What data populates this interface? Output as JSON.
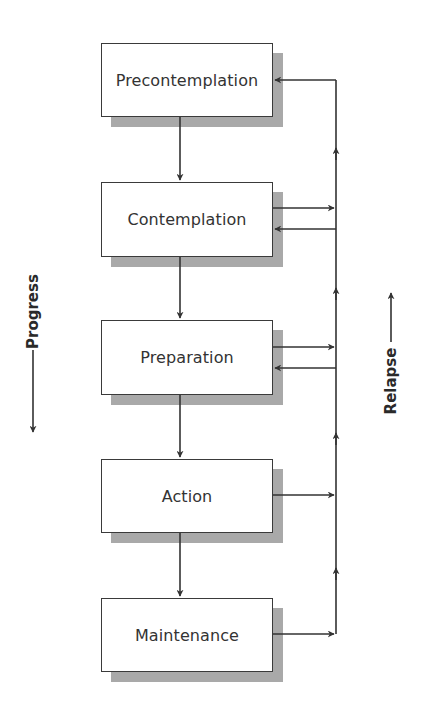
{
  "diagram": {
    "stages": [
      {
        "label": "Precontemplation"
      },
      {
        "label": "Contemplation"
      },
      {
        "label": "Preparation"
      },
      {
        "label": "Action"
      },
      {
        "label": "Maintenance"
      }
    ],
    "left_axis": {
      "label": "Progress",
      "direction": "down"
    },
    "right_axis": {
      "label": "Relapse",
      "direction": "up"
    },
    "connections": {
      "progress_flow": [
        "Precontemplation",
        "Contemplation",
        "Preparation",
        "Action",
        "Maintenance"
      ],
      "relapse_outputs": [
        "Contemplation",
        "Preparation",
        "Action",
        "Maintenance"
      ],
      "relapse_returns": [
        "Precontemplation",
        "Contemplation",
        "Preparation"
      ]
    },
    "colors": {
      "line": "#333333",
      "shadow": "#a9a9a9",
      "box_fill": "#ffffff",
      "text": "#333333"
    }
  }
}
